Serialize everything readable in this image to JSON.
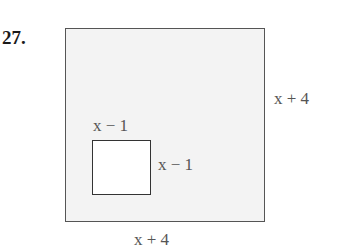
{
  "problem": {
    "number": "27."
  },
  "figure": {
    "outer_square": {
      "side_label_right": "x + 4",
      "side_label_bottom": "x + 4"
    },
    "inner_square": {
      "side_label_top": "x − 1",
      "side_label_right": "x − 1"
    }
  }
}
